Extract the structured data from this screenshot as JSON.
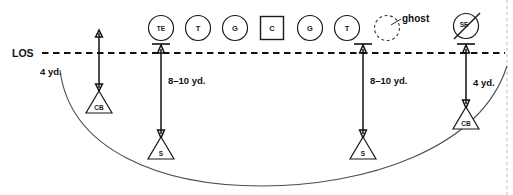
{
  "diagram": {
    "los": {
      "label": "LOS",
      "y": 53,
      "x_start": 42,
      "x_end": 505,
      "color": "#111111"
    },
    "offense": {
      "players": [
        {
          "id": "te",
          "label": "TE",
          "shape": "circle",
          "x": 161,
          "y": 28,
          "r": 12.5
        },
        {
          "id": "lt",
          "label": "T",
          "shape": "circle",
          "x": 198,
          "y": 28,
          "r": 12.5
        },
        {
          "id": "lg",
          "label": "G",
          "shape": "circle",
          "x": 235,
          "y": 28,
          "r": 12.5
        },
        {
          "id": "center",
          "label": "C",
          "shape": "square",
          "x": 272,
          "y": 28,
          "r": 11.5
        },
        {
          "id": "rg",
          "label": "G",
          "shape": "circle",
          "x": 310,
          "y": 28,
          "r": 12.5
        },
        {
          "id": "rt",
          "label": "T",
          "shape": "circle",
          "x": 347,
          "y": 28,
          "r": 12.5
        },
        {
          "id": "ghost",
          "label": "",
          "shape": "ghost",
          "x": 387,
          "y": 28,
          "r": 12.5
        },
        {
          "id": "se",
          "label": "SE",
          "shape": "circle-slashed",
          "x": 466,
          "y": 26,
          "r": 12.5
        }
      ],
      "ghost_annotation": {
        "label": "ghost",
        "text_x": 404,
        "text_y": 18,
        "leader": {
          "x1": 401,
          "y1": 20,
          "x2": 391,
          "y2": 26
        }
      }
    },
    "defense": {
      "players": [
        {
          "id": "cb-left",
          "label": "CB",
          "shape": "triangle",
          "x": 99,
          "y": 104,
          "size": 13
        },
        {
          "id": "s-left",
          "label": "S",
          "shape": "triangle",
          "x": 161,
          "y": 150,
          "size": 13
        },
        {
          "id": "s-right",
          "label": "S",
          "shape": "triangle",
          "x": 363,
          "y": 150,
          "size": 13
        },
        {
          "id": "cb-right",
          "label": "CB",
          "shape": "triangle",
          "x": 466,
          "y": 120,
          "size": 13
        }
      ]
    },
    "measurements": [
      {
        "id": "cb-left-depth",
        "label": "4 yd.",
        "x": 99,
        "y_top": 31,
        "y_bottom": 90,
        "label_x": 63,
        "label_y": 72,
        "tick_at_top": false,
        "arrow_top": true,
        "arrow_bottom": true
      },
      {
        "id": "s-left-depth",
        "label": "8–10 yd.",
        "x": 161,
        "y_top": 46,
        "y_bottom": 136,
        "label_x": 168,
        "label_y": 81,
        "tick_at_top": true,
        "arrow_top": true,
        "arrow_bottom": true
      },
      {
        "id": "s-right-depth",
        "label": "8–10 yd.",
        "x": 363,
        "y_top": 46,
        "y_bottom": 136,
        "label_x": 370,
        "label_y": 81,
        "tick_at_top": true,
        "arrow_top": true,
        "arrow_bottom": true
      },
      {
        "id": "cb-right-depth",
        "label": "4 yd.",
        "x": 466,
        "y_top": 46,
        "y_bottom": 106,
        "label_x": 473,
        "label_y": 83,
        "tick_at_top": true,
        "arrow_top": true,
        "arrow_bottom": true
      }
    ],
    "coverage_arc": {
      "description": "deep zone coverage boundary arc",
      "path": "M 60 70 C 70 150 160 186 262 186 C 364 186 480 150 507 66"
    },
    "edge_border": {
      "right_x": 507,
      "y_top": 0,
      "y_bottom": 195
    }
  }
}
